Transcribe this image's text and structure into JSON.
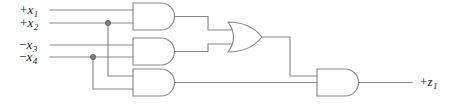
{
  "diagram": {
    "background_color": "#ffffff",
    "line_color": "#8a8a8a",
    "text_color": "#1c1c1c",
    "inputs": [
      {
        "id": "x1",
        "sign": "+",
        "var": "x",
        "subscript": "1",
        "label": "+x1",
        "y": 10
      },
      {
        "id": "x2",
        "sign": "+",
        "var": "x",
        "subscript": "2",
        "label": "+x2",
        "y": 23
      },
      {
        "id": "x3",
        "sign": "−",
        "var": "x",
        "subscript": "3",
        "label": "−x3",
        "y": 45
      },
      {
        "id": "x4",
        "sign": "−",
        "var": "x",
        "subscript": "4",
        "label": "−x4",
        "y": 57
      }
    ],
    "outputs": [
      {
        "id": "z1",
        "sign": "+",
        "var": "z",
        "subscript": "1",
        "label": "+z1",
        "y": 82
      }
    ],
    "gates": [
      {
        "id": "and-1",
        "type": "AND",
        "inputs": [
          "x1",
          "x2"
        ],
        "output": "and1-out"
      },
      {
        "id": "and-2",
        "type": "AND",
        "inputs": [
          "x3",
          "x4"
        ],
        "output": "and2-out"
      },
      {
        "id": "and-3",
        "type": "AND",
        "inputs": [
          "x2",
          "x4"
        ],
        "output": "and3-out"
      },
      {
        "id": "or-1",
        "type": "OR",
        "inputs": [
          "and1-out",
          "and2-out"
        ],
        "output": "or1-out"
      },
      {
        "id": "and-4",
        "type": "AND",
        "inputs": [
          "or1-out",
          "and3-out"
        ],
        "output": "z1"
      }
    ],
    "junctions": [
      {
        "id": "junction-x2",
        "on": "x2",
        "x": 108,
        "y": 23
      },
      {
        "id": "junction-x4",
        "on": "x4",
        "x": 93,
        "y": 57
      }
    ]
  }
}
